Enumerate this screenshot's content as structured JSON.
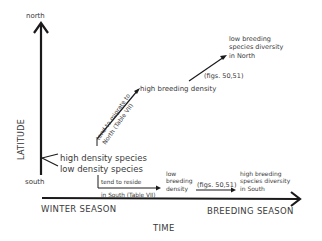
{
  "diagram": {
    "y_axis": {
      "label": "LATITUDE",
      "top": "north",
      "bottom": "south"
    },
    "x_axis": {
      "label": "TIME",
      "left": "WINTER SEASON",
      "right": "BREEDING SEASON"
    },
    "start_labels": {
      "high": "high density species",
      "low": "low density species"
    },
    "north_path": {
      "migrate_line1": "tend to migrate to",
      "migrate_line2": "North (Table VII)",
      "node": "high breeding density",
      "figs": "(figs. 50,51)",
      "end_line1": "low breeding",
      "end_line2": "species diversity",
      "end_line3": "in North"
    },
    "south_path": {
      "reside_line1": "tend to reside",
      "reside_line2": "in South (Table VII)",
      "node_line1": "low",
      "node_line2": "breeding",
      "node_line3": "density",
      "figs": "(figs. 50,51)",
      "end_line1": "high breeding",
      "end_line2": "species diversity",
      "end_line3": "in South"
    },
    "colors": {
      "ink": "#1a1a1a",
      "text": "#3a3a3a",
      "background": "#ffffff"
    }
  }
}
